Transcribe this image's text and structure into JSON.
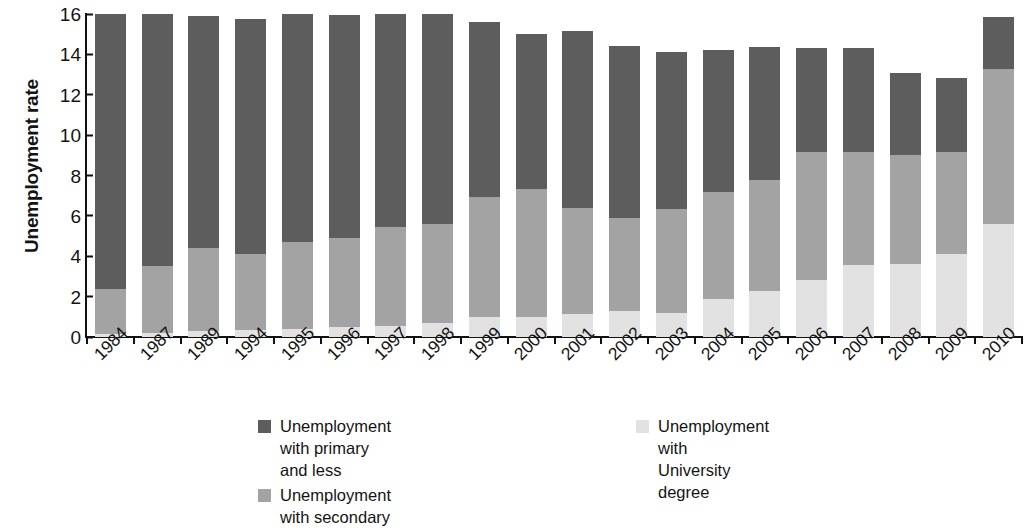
{
  "chart_data": {
    "type": "bar",
    "subtype": "stacked-bar",
    "title": "",
    "xlabel": "",
    "ylabel": "Unemployment rate",
    "ylim": [
      0,
      16
    ],
    "yticks": [
      0,
      2,
      4,
      6,
      8,
      10,
      12,
      14,
      16
    ],
    "grid": false,
    "legend_position": "bottom",
    "categories": [
      "1984",
      "1987",
      "1989",
      "1994",
      "1995",
      "1996",
      "1997",
      "1998",
      "1999",
      "2000",
      "2001",
      "2002",
      "2003",
      "2004",
      "2005",
      "2006",
      "2007",
      "2008",
      "2009",
      "2010"
    ],
    "series": [
      {
        "name": "Unemployment with University degree",
        "color": "#e2e2e2",
        "values": [
          0.15,
          0.2,
          0.3,
          0.35,
          0.4,
          0.5,
          0.55,
          0.7,
          1.0,
          1.0,
          1.15,
          1.3,
          1.2,
          1.9,
          2.3,
          2.8,
          3.55,
          3.6,
          4.1,
          5.6
        ]
      },
      {
        "name": "Unemployment with secondary",
        "color": "#a3a3a3",
        "values": [
          2.25,
          3.3,
          4.1,
          3.75,
          4.3,
          4.4,
          4.9,
          4.9,
          5.95,
          6.35,
          5.25,
          4.6,
          5.15,
          5.3,
          5.5,
          6.35,
          5.6,
          5.4,
          5.05,
          7.7
        ]
      },
      {
        "name": "Unemployment with primary and less",
        "color": "#5d5d5d",
        "values": [
          13.6,
          12.5,
          11.5,
          11.65,
          11.3,
          11.05,
          10.55,
          10.4,
          8.65,
          7.65,
          8.75,
          8.5,
          7.75,
          7.0,
          6.55,
          5.15,
          5.15,
          4.1,
          3.7,
          2.55
        ]
      }
    ],
    "stack_totals": [
      16.0,
      16.0,
      15.9,
      15.75,
      16.0,
      15.95,
      16.0,
      16.0,
      15.6,
      15.0,
      15.15,
      14.4,
      14.1,
      14.2,
      14.35,
      14.3,
      14.3,
      13.1,
      12.85,
      15.85
    ]
  },
  "legend": {
    "items": [
      {
        "label": "Unemployment with primary and less",
        "color": "#5d5d5d"
      },
      {
        "label": "Unemployment with secondary",
        "color": "#a3a3a3"
      },
      {
        "label": "Unemployment with\nUniversity degree",
        "color": "#e2e2e2"
      }
    ]
  }
}
